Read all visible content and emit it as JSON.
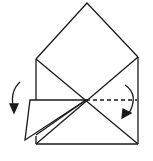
{
  "diagram": {
    "type": "origami-fold-step",
    "colors": {
      "line": "#1a1a1a",
      "background": "#ffffff"
    },
    "elements": [
      {
        "name": "roof-triangle",
        "kind": "folded-flap"
      },
      {
        "name": "body-square",
        "kind": "paper-outline"
      },
      {
        "name": "diagonal-creases",
        "kind": "crease"
      },
      {
        "name": "left-folded-flap",
        "kind": "flap"
      },
      {
        "name": "valley-fold-line",
        "kind": "dashed-fold-line"
      },
      {
        "name": "left-fold-arrow",
        "kind": "curved-arrow"
      },
      {
        "name": "right-fold-arrow",
        "kind": "curved-arrow"
      }
    ]
  }
}
